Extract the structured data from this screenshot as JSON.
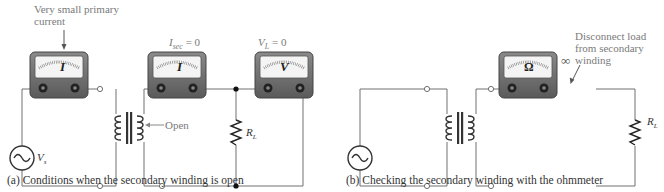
{
  "figure_a": {
    "annotation_primary": "Very small primary current",
    "annotation_primary_line1": "Very small primary",
    "annotation_primary_line2": "current",
    "isec_label": "I",
    "isec_sub": "sec",
    "isec_value": " = 0",
    "vl_label": "V",
    "vl_sub": "L",
    "vl_value": " = 0",
    "meter1_symbol": "I",
    "meter2_symbol": "I",
    "meter3_symbol": "V",
    "source_label": "V",
    "source_sub": "s",
    "open_label": "Open",
    "load_label": "R",
    "load_sub": "L",
    "caption": "(a) Conditions when the secondary winding is open"
  },
  "figure_b": {
    "meter_symbol": "Ω",
    "infinity": "∞",
    "annotation_line1": "Disconnect load",
    "annotation_line2": "from secondary",
    "annotation_line3": "winding",
    "load_label": "R",
    "load_sub": "L",
    "caption": "(b) Checking the secondary winding with the ohmmeter"
  },
  "colors": {
    "wire": "#707070",
    "meter_body": "#6e6e6e",
    "meter_face": "#f2f2f2",
    "annotation_text": "#7a7a7a"
  }
}
